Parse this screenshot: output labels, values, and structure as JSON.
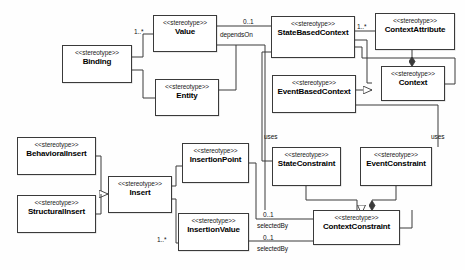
{
  "diagram": {
    "kind": "uml-class-diagram",
    "stereotype_label": "<<stereotype>>",
    "width": 465,
    "height": 270,
    "line_color": "#3a3a3a",
    "background": "#ffffff"
  },
  "classes": [
    {
      "id": "binding",
      "name": "Binding",
      "stereotype": "<<stereotype>>",
      "x": 62,
      "y": 45,
      "w": 70,
      "h": 38
    },
    {
      "id": "value",
      "name": "Value",
      "stereotype": "<<stereotype>>",
      "x": 153,
      "y": 15,
      "w": 64,
      "h": 37
    },
    {
      "id": "entity",
      "name": "Entity",
      "stereotype": "<<stereotype>>",
      "x": 155,
      "y": 79,
      "w": 64,
      "h": 37
    },
    {
      "id": "statebasedcontext",
      "name": "StateBasedContext",
      "stereotype": "<<stereotype>>",
      "x": 271,
      "y": 16,
      "w": 84,
      "h": 42
    },
    {
      "id": "contextattribute",
      "name": "ContextAttribute",
      "stereotype": "<<stereotype>>",
      "x": 375,
      "y": 13,
      "w": 80,
      "h": 37
    },
    {
      "id": "context",
      "name": "Context",
      "stereotype": "<<stereotype>>",
      "x": 381,
      "y": 66,
      "w": 64,
      "h": 35
    },
    {
      "id": "eventbasedcontext",
      "name": "EventBasedContext",
      "stereotype": "<<stereotype>>",
      "x": 272,
      "y": 75,
      "w": 84,
      "h": 38
    },
    {
      "id": "behavioralinsert",
      "name": "BehavioralInsert",
      "stereotype": "<<stereotype>>",
      "x": 17,
      "y": 137,
      "w": 79,
      "h": 38
    },
    {
      "id": "structuralinsert",
      "name": "StructuralInsert",
      "stereotype": "<<stereotype>>",
      "x": 17,
      "y": 195,
      "w": 79,
      "h": 38
    },
    {
      "id": "insert",
      "name": "Insert",
      "stereotype": "<<stereotype>>",
      "x": 108,
      "y": 176,
      "w": 64,
      "h": 37
    },
    {
      "id": "insertionpoint",
      "name": "InsertionPoint",
      "stereotype": "<<stereotype>>",
      "x": 182,
      "y": 143,
      "w": 67,
      "h": 40
    },
    {
      "id": "insertionvalue",
      "name": "InsertionValue",
      "stereotype": "<<stereotype>>",
      "x": 178,
      "y": 213,
      "w": 71,
      "h": 38
    },
    {
      "id": "stateconstraint",
      "name": "StateConstraint",
      "stereotype": "<<stereotype>>",
      "x": 272,
      "y": 147,
      "w": 69,
      "h": 39
    },
    {
      "id": "eventconstraint",
      "name": "EventConstraint",
      "stereotype": "<<stereotype>>",
      "x": 360,
      "y": 147,
      "w": 72,
      "h": 39
    },
    {
      "id": "contextconstraint",
      "name": "ContextConstraint",
      "stereotype": "<<stereotype>>",
      "x": 313,
      "y": 210,
      "w": 87,
      "h": 35
    }
  ],
  "edge_labels": [
    {
      "id": "dependson",
      "text": "dependsOn",
      "x": 220,
      "y": 31
    },
    {
      "id": "uses-state",
      "text": "uses",
      "x": 264,
      "y": 133
    },
    {
      "id": "uses-event",
      "text": "uses",
      "x": 431,
      "y": 133
    },
    {
      "id": "selectedby1",
      "text": "selectedBy",
      "x": 257,
      "y": 222
    },
    {
      "id": "selectedby2",
      "text": "selectedBy",
      "x": 257,
      "y": 245
    }
  ],
  "multiplicities": [
    {
      "id": "m-binding-value",
      "text": "1..*",
      "x": 134,
      "y": 28
    },
    {
      "id": "m-value-dependson",
      "text": "0..1",
      "x": 243,
      "y": 18
    },
    {
      "id": "m-state-contextattribute",
      "text": "1..*",
      "x": 357,
      "y": 23
    },
    {
      "id": "m-insert-insertionvalue",
      "text": "1..*",
      "x": 157,
      "y": 236
    },
    {
      "id": "m-insertionpoint-selected",
      "text": "0..1",
      "x": 263,
      "y": 211
    },
    {
      "id": "m-insertionvalue-selected",
      "text": "0..1",
      "x": 263,
      "y": 234
    }
  ]
}
